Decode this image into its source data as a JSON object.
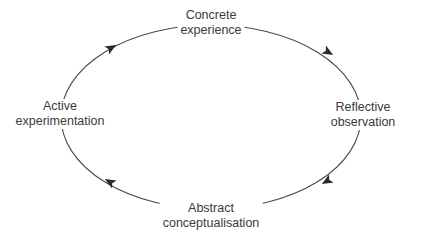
{
  "diagram": {
    "direction": "clockwise",
    "stages": [
      {
        "id": "top",
        "lines": [
          "Concrete",
          "experience"
        ]
      },
      {
        "id": "right",
        "lines": [
          "Reflective",
          "observation"
        ]
      },
      {
        "id": "bottom",
        "lines": [
          "Abstract",
          "conceptualisation"
        ]
      },
      {
        "id": "left",
        "lines": [
          "Active",
          "experimentation"
        ]
      }
    ],
    "colors": {
      "line": "#3a3a3a",
      "text": "#3a3a3a",
      "background": "#ffffff"
    }
  }
}
